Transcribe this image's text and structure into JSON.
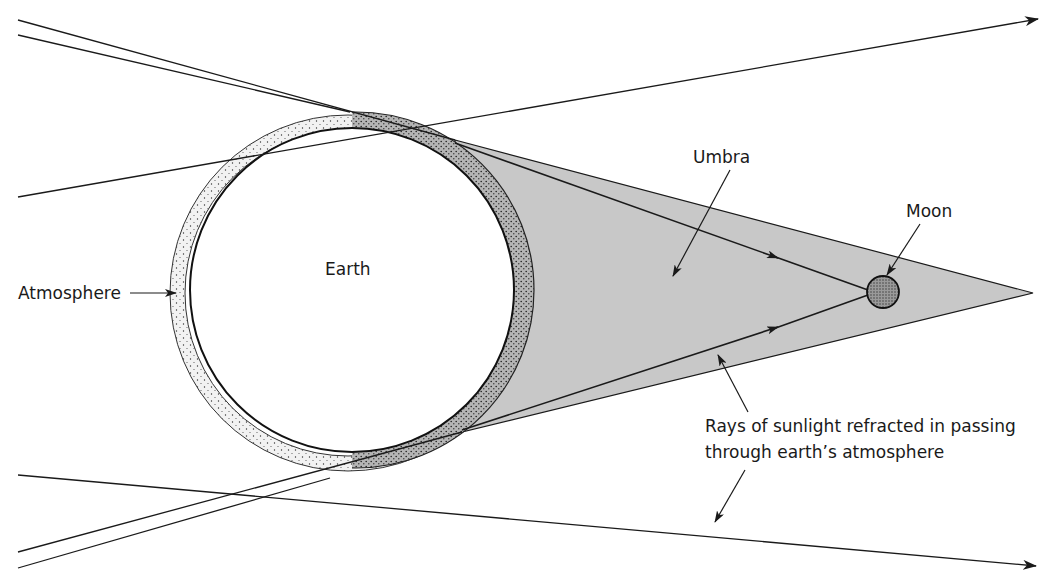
{
  "diagram": {
    "title": "",
    "type": "lunar-eclipse-umbra",
    "labels": {
      "earth": "Earth",
      "atmosphere": "Atmosphere",
      "umbra": "Umbra",
      "moon": "Moon",
      "rays_line1": "Rays of sunlight refracted in passing",
      "rays_line2": "through earth’s atmosphere"
    },
    "colors": {
      "ink": "#1a1a1a",
      "umbra_fill": "#c8c8c8",
      "moon_fill": "#8f8f8f",
      "atmosphere_stipple": "#e9e9e9",
      "background": "#ffffff"
    },
    "elements": [
      {
        "name": "Earth",
        "shape": "circle",
        "center": [
          352,
          290
        ],
        "radius": 162
      },
      {
        "name": "Atmosphere",
        "shape": "ring",
        "center": [
          348,
          293
        ],
        "outer_radius": 178,
        "inner_radius": 163
      },
      {
        "name": "Umbra",
        "shape": "triangle",
        "points": [
          [
            455,
            140
          ],
          [
            1033,
            293
          ],
          [
            462,
            432
          ]
        ]
      },
      {
        "name": "Moon",
        "shape": "circle",
        "center": [
          883,
          292
        ],
        "radius": 16
      },
      {
        "name": "Refracted ray (upper)",
        "from": [
          455,
          143
        ],
        "to": [
          867,
          289
        ]
      },
      {
        "name": "Refracted ray (lower)",
        "from": [
          462,
          430
        ],
        "to": [
          867,
          295
        ]
      }
    ]
  }
}
